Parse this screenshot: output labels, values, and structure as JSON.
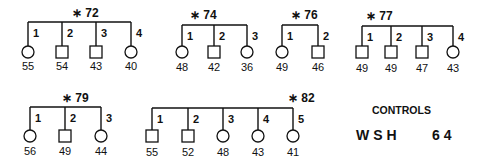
{
  "families": [
    {
      "id": "*72",
      "bar": {
        "y": 22,
        "x1": 28,
        "x2": 131
      },
      "title_pos": {
        "x": 72,
        "y": 17
      },
      "drop_y": 46,
      "value_y": 70,
      "members": [
        {
          "n": "1",
          "shape": "circle",
          "x": 28,
          "value": "55"
        },
        {
          "n": "2",
          "shape": "square",
          "x": 62,
          "value": "54"
        },
        {
          "n": "3",
          "shape": "square",
          "x": 96,
          "value": "43"
        },
        {
          "n": "4",
          "shape": "circle",
          "x": 131,
          "value": "40"
        }
      ]
    },
    {
      "id": "*74",
      "bar": {
        "y": 25,
        "x1": 182,
        "x2": 247
      },
      "title_pos": {
        "x": 190,
        "y": 19
      },
      "drop_y": 46,
      "value_y": 71,
      "members": [
        {
          "n": "1",
          "shape": "circle",
          "x": 182,
          "value": "48"
        },
        {
          "n": "2",
          "shape": "square",
          "x": 214,
          "value": "42"
        },
        {
          "n": "3",
          "shape": "circle",
          "x": 247,
          "value": "36"
        }
      ]
    },
    {
      "id": "*76",
      "bar": {
        "y": 25,
        "x1": 282,
        "x2": 318
      },
      "title_pos": {
        "x": 291,
        "y": 19
      },
      "drop_y": 46,
      "value_y": 71,
      "members": [
        {
          "n": "1",
          "shape": "circle",
          "x": 282,
          "value": "49"
        },
        {
          "n": "2",
          "shape": "square",
          "x": 318,
          "value": "46"
        }
      ]
    },
    {
      "id": "*77",
      "bar": {
        "y": 26,
        "x1": 362,
        "x2": 453
      },
      "title_pos": {
        "x": 366,
        "y": 20
      },
      "drop_y": 46,
      "value_y": 72,
      "members": [
        {
          "n": "1",
          "shape": "square",
          "x": 362,
          "value": "49"
        },
        {
          "n": "2",
          "shape": "square",
          "x": 391,
          "value": "49"
        },
        {
          "n": "3",
          "shape": "square",
          "x": 422,
          "value": "47"
        },
        {
          "n": "4",
          "shape": "circle",
          "x": 453,
          "value": "43"
        }
      ]
    },
    {
      "id": "*79",
      "bar": {
        "y": 107,
        "x1": 30,
        "x2": 101
      },
      "title_pos": {
        "x": 62,
        "y": 102
      },
      "drop_y": 130,
      "value_y": 155,
      "members": [
        {
          "n": "1",
          "shape": "circle",
          "x": 30,
          "value": "56"
        },
        {
          "n": "2",
          "shape": "square",
          "x": 65,
          "value": "49"
        },
        {
          "n": "3",
          "shape": "circle",
          "x": 101,
          "value": "44"
        }
      ]
    },
    {
      "id": "*82",
      "bar": {
        "y": 108,
        "x1": 152,
        "x2": 293
      },
      "title_pos": {
        "x": 288,
        "y": 102
      },
      "drop_y": 130,
      "value_y": 156,
      "members": [
        {
          "n": "1",
          "shape": "square",
          "x": 152,
          "value": "55"
        },
        {
          "n": "2",
          "shape": "square",
          "x": 188,
          "value": "52"
        },
        {
          "n": "3",
          "shape": "circle",
          "x": 223,
          "value": "48"
        },
        {
          "n": "4",
          "shape": "circle",
          "x": 258,
          "value": "43"
        },
        {
          "n": "5",
          "shape": "circle",
          "x": 293,
          "value": "41"
        }
      ]
    }
  ],
  "controls": {
    "heading": "CONTROLS",
    "label": "WSH",
    "value": "64"
  },
  "colors": {
    "ink": "#111111",
    "background": "#ffffff"
  }
}
